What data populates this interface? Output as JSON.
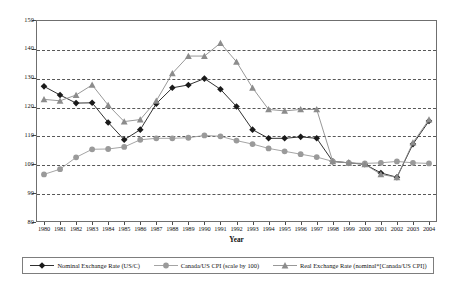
{
  "chart_data": {
    "type": "line",
    "title": "",
    "xlabel": "Year",
    "ylabel": "",
    "ylim": [
      80,
      150
    ],
    "yticks": [
      80,
      90,
      100,
      110,
      120,
      130,
      140,
      150
    ],
    "grid": true,
    "legend_position": "bottom",
    "categories": [
      "1980",
      "1981",
      "1982",
      "1983",
      "1984",
      "1985",
      "1986",
      "1987",
      "1988",
      "1989",
      "1990",
      "1991",
      "1992",
      "1993",
      "1994",
      "1995",
      "1996",
      "1997",
      "1998",
      "1999",
      "2000",
      "2001",
      "2002",
      "2003",
      "2004"
    ],
    "series": [
      {
        "name": "Nominal Exchange Rate (US/C)",
        "color": "#1a1a1a",
        "marker": "diamond",
        "values": [
          127.0,
          124.0,
          121.2,
          121.3,
          114.5,
          108.5,
          112.0,
          121.0,
          126.5,
          127.5,
          129.7,
          126.0,
          120.0,
          112.0,
          109.0,
          109.0,
          109.5,
          109.0,
          101.0,
          100.5,
          100.0,
          97.0,
          95.5,
          107.0,
          115.0
        ]
      },
      {
        "name": "Canada/US CPI (scale by 100)",
        "color": "#9a9a9a",
        "marker": "circle",
        "values": [
          96.5,
          98.3,
          102.4,
          105.2,
          105.3,
          106.0,
          108.5,
          109.0,
          109.0,
          109.2,
          110.0,
          109.7,
          108.2,
          107.0,
          105.5,
          104.5,
          103.5,
          102.5,
          101.0,
          100.5,
          100.3,
          100.5,
          101.0,
          100.5,
          100.3
        ]
      },
      {
        "name": "Real Exchange Rate (nominal*[Canada/US CPI])",
        "color": "#8c8c8c",
        "marker": "triangle",
        "values": [
          122.5,
          122.0,
          124.0,
          127.5,
          120.5,
          114.8,
          115.5,
          122.0,
          131.5,
          137.5,
          137.5,
          142.0,
          135.5,
          126.5,
          119.0,
          118.5,
          119.0,
          119.0,
          101.0,
          100.5,
          100.0,
          96.5,
          95.5,
          107.5,
          115.5
        ]
      }
    ]
  },
  "axes": {
    "x_title": "Year"
  },
  "legend": {
    "items": [
      {
        "label": "Nominal Exchange Rate (US/C)"
      },
      {
        "label": "Canada/US CPI (scale by 100)"
      },
      {
        "label": "Real Exchange Rate (nominal*[Canada/US CPI])"
      }
    ]
  }
}
